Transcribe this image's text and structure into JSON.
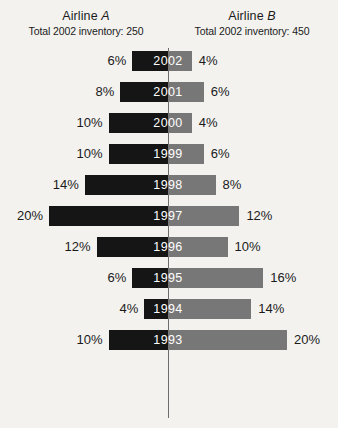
{
  "header": {
    "left": {
      "title_prefix": "Airline ",
      "title_letter": "A",
      "subtitle": "Total 2002 inventory: 250"
    },
    "right": {
      "title_prefix": "Airline ",
      "title_letter": "B",
      "subtitle": "Total 2002 inventory: 450"
    }
  },
  "colors": {
    "background": "#f3f2ef",
    "left_bar": "#151515",
    "right_bar": "#777777",
    "axis": "#6d6d6d",
    "text": "#1b1b1b",
    "year_text": "#ffffff"
  },
  "chart_data": {
    "type": "bar",
    "subtype": "diverging-horizontal-bar",
    "orientation": "horizontal",
    "xlabel": "",
    "ylabel": "",
    "grid": false,
    "legend_position": "top",
    "axis_center_label": "0%",
    "categories": [
      "2002",
      "2001",
      "2000",
      "1999",
      "1998",
      "1997",
      "1996",
      "1995",
      "1994",
      "1993"
    ],
    "series": [
      {
        "name": "Airline A",
        "side": "left",
        "color": "#151515",
        "total_2002_inventory": 250,
        "unit": "%",
        "values": [
          6,
          8,
          10,
          10,
          14,
          20,
          12,
          6,
          4,
          10
        ],
        "labels": [
          "6%",
          "8%",
          "10%",
          "10%",
          "14%",
          "20%",
          "12%",
          "6%",
          "4%",
          "10%"
        ]
      },
      {
        "name": "Airline B",
        "side": "right",
        "color": "#777777",
        "total_2002_inventory": 450,
        "unit": "%",
        "values": [
          4,
          6,
          4,
          6,
          8,
          12,
          10,
          16,
          14,
          20
        ],
        "labels": [
          "4%",
          "6%",
          "4%",
          "6%",
          "8%",
          "12%",
          "10%",
          "16%",
          "14%",
          "20%"
        ]
      }
    ],
    "xlim": [
      -20,
      20
    ],
    "px_per_percent": 5.95
  }
}
